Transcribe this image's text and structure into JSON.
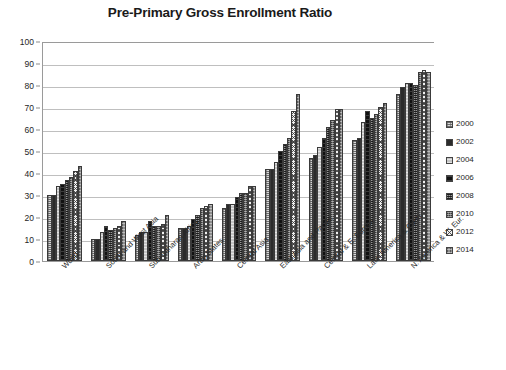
{
  "chart_data": {
    "type": "bar",
    "title": "Pre-Primary Gross Enrollment Ratio",
    "xlabel": "",
    "ylabel": "",
    "ylim": [
      0,
      100
    ],
    "ytick_step": 10,
    "yticks": [
      0,
      10,
      20,
      30,
      40,
      50,
      60,
      70,
      80,
      90,
      100
    ],
    "grid": true,
    "legend_position": "right",
    "categories": [
      "World",
      "South and West Asia",
      "Sub-Saharan Africa",
      "Arab States",
      "Central Asia",
      "East Asia and Pacific",
      "Central & E. Europe",
      "Latin America & Carib.",
      "N. America & W. Eur."
    ],
    "series": [
      {
        "name": "2000",
        "values": [
          30,
          10,
          12,
          15,
          24,
          42,
          47,
          55,
          76
        ]
      },
      {
        "name": "2002",
        "values": [
          30,
          10,
          13,
          15,
          26,
          42,
          48,
          56,
          79
        ]
      },
      {
        "name": "2004",
        "values": [
          34,
          13,
          13,
          16,
          26,
          45,
          52,
          63,
          81
        ]
      },
      {
        "name": "2006",
        "values": [
          35,
          16,
          18,
          19,
          29,
          50,
          56,
          68,
          81
        ]
      },
      {
        "name": "2008",
        "values": [
          37,
          14,
          16,
          21,
          31,
          53,
          61,
          65,
          80
        ]
      },
      {
        "name": "2010",
        "values": [
          38,
          15,
          16,
          24,
          31,
          56,
          64,
          67,
          86
        ]
      },
      {
        "name": "2012",
        "values": [
          41,
          16,
          17,
          25,
          34,
          68,
          69,
          70,
          87
        ]
      },
      {
        "name": "2014",
        "values": [
          43,
          18,
          21,
          26,
          34,
          76,
          69,
          72,
          86
        ]
      }
    ]
  },
  "legend": {
    "entries": [
      {
        "label": "2000",
        "swatch": "series-swatch-2000"
      },
      {
        "label": "2002",
        "swatch": "series-swatch-2002"
      },
      {
        "label": "2004",
        "swatch": "series-swatch-2004"
      },
      {
        "label": "2006",
        "swatch": "series-swatch-2006"
      },
      {
        "label": "2008",
        "swatch": "series-swatch-2008"
      },
      {
        "label": "2010",
        "swatch": "series-swatch-2010"
      },
      {
        "label": "2012",
        "swatch": "series-swatch-2012"
      },
      {
        "label": "2014",
        "swatch": "series-swatch-2014"
      }
    ]
  },
  "colors": {
    "background": "#ffffff",
    "gridline": "#bfbfbf",
    "axis": "#9a9a9a",
    "text": "#262626",
    "title": "#1a1a1a"
  }
}
